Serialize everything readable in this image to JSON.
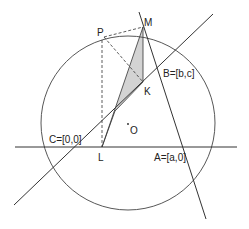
{
  "diagram": {
    "type": "geometry",
    "colors": {
      "stroke": "#333333",
      "shade": "#d3d3d3",
      "background": "#ffffff"
    },
    "circle": {
      "label": "O",
      "cx": 128,
      "cy": 123,
      "r": 87
    },
    "points": {
      "M": {
        "label": "M",
        "x": 143,
        "y": 27
      },
      "P": {
        "label": "P",
        "x": 104,
        "y": 37
      },
      "K": {
        "label": "K",
        "x": 143,
        "y": 82
      },
      "L": {
        "label": "L",
        "x": 102,
        "y": 147
      },
      "O": {
        "label": "O",
        "x": 128,
        "y": 124
      },
      "B": {
        "label": "B=[b,c]"
      },
      "C": {
        "label": "C=[0,0]"
      },
      "A": {
        "label": "A=[a,0]"
      }
    },
    "lines": [
      {
        "name": "line-CB",
        "x1": 14,
        "y1": 205,
        "x2": 213,
        "y2": 14
      },
      {
        "name": "line-CA",
        "x1": 15,
        "y1": 147,
        "x2": 237,
        "y2": 147
      },
      {
        "name": "line-MA",
        "x1": 139,
        "y1": 12,
        "x2": 206,
        "y2": 219
      }
    ],
    "dashed": [
      {
        "name": "dash-PM",
        "from": "P",
        "to": "M"
      },
      {
        "name": "dash-PK",
        "from": "P",
        "to": "K"
      },
      {
        "name": "dash-PL",
        "from": "P",
        "to": "L"
      }
    ],
    "shaded_polygon": "L-M-K-CB"
  }
}
